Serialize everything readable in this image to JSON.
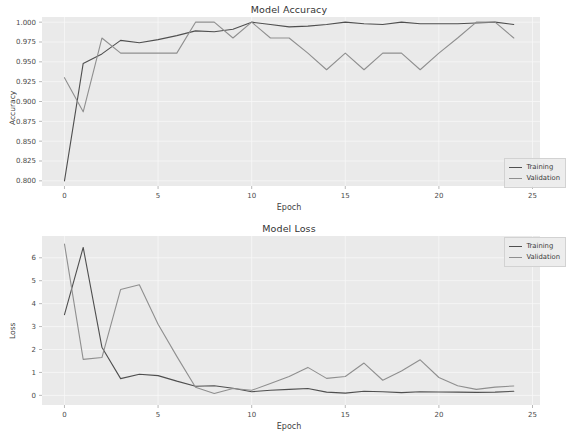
{
  "figure": {
    "width": 578,
    "height": 438,
    "background": "#ffffff",
    "plot_background": "#eaeaea",
    "grid_color": "#f7f7f7"
  },
  "colors": {
    "training": "#4f4f4f",
    "validation": "#8f8f8f",
    "text": "#3b3b3b"
  },
  "chart_data": [
    {
      "type": "line",
      "title": "Model Accuracy",
      "xlabel": "Epoch",
      "ylabel": "Accuracy",
      "xlim": [
        -1.2,
        25.4
      ],
      "ylim": [
        0.7935,
        1.0065
      ],
      "xticks": [
        0,
        5,
        10,
        15,
        20,
        25
      ],
      "xtick_labels": [
        "0",
        "5",
        "10",
        "15",
        "20",
        "25"
      ],
      "yticks": [
        0.8,
        0.825,
        0.85,
        0.875,
        0.9,
        0.925,
        0.95,
        0.975,
        1.0
      ],
      "ytick_labels": [
        "0.800",
        "0.825",
        "0.850",
        "0.875",
        "0.900",
        "0.925",
        "0.950",
        "0.975",
        "1.000"
      ],
      "grid": true,
      "legend_position": "lower right",
      "x": [
        0,
        1,
        2,
        3,
        4,
        5,
        6,
        7,
        8,
        9,
        10,
        11,
        12,
        13,
        14,
        15,
        16,
        17,
        18,
        19,
        20,
        21,
        22,
        23,
        24
      ],
      "series": [
        {
          "name": "Training",
          "values": [
            0.8,
            0.948,
            0.96,
            0.977,
            0.974,
            0.978,
            0.983,
            0.989,
            0.988,
            0.991,
            1.0,
            0.997,
            0.994,
            0.995,
            0.997,
            1.0,
            0.998,
            0.997,
            1.0,
            0.998,
            0.998,
            0.998,
            0.999,
            1.0,
            0.997
          ]
        },
        {
          "name": "Validation",
          "values": [
            0.93,
            0.887,
            0.98,
            0.961,
            0.961,
            0.961,
            0.961,
            1.0,
            1.0,
            0.98,
            1.0,
            0.98,
            0.98,
            0.961,
            0.94,
            0.961,
            0.94,
            0.961,
            0.961,
            0.94,
            0.961,
            0.98,
            1.0,
            1.0,
            0.98
          ]
        }
      ]
    },
    {
      "type": "line",
      "title": "Model Loss",
      "xlabel": "Epoch",
      "ylabel": "Loss",
      "xlim": [
        -1.2,
        25.4
      ],
      "ylim": [
        -0.42,
        6.95
      ],
      "xticks": [
        0,
        5,
        10,
        15,
        20,
        25
      ],
      "xtick_labels": [
        "0",
        "5",
        "10",
        "15",
        "20",
        "25"
      ],
      "yticks": [
        0,
        1,
        2,
        3,
        4,
        5,
        6
      ],
      "ytick_labels": [
        "0",
        "1",
        "2",
        "3",
        "4",
        "5",
        "6"
      ],
      "grid": true,
      "legend_position": "upper right",
      "x": [
        0,
        1,
        2,
        3,
        4,
        5,
        6,
        7,
        8,
        9,
        10,
        11,
        12,
        13,
        14,
        15,
        16,
        17,
        18,
        19,
        20,
        21,
        22,
        23,
        24
      ],
      "series": [
        {
          "name": "Training",
          "values": [
            3.52,
            6.45,
            2.1,
            0.73,
            0.92,
            0.86,
            0.62,
            0.4,
            0.42,
            0.31,
            0.16,
            0.22,
            0.26,
            0.3,
            0.14,
            0.1,
            0.18,
            0.16,
            0.12,
            0.16,
            0.15,
            0.14,
            0.13,
            0.14,
            0.18
          ]
        },
        {
          "name": "Validation",
          "values": [
            6.6,
            1.57,
            1.65,
            4.62,
            4.82,
            3.1,
            1.7,
            0.35,
            0.08,
            0.3,
            0.22,
            0.52,
            0.82,
            1.22,
            0.74,
            0.82,
            1.41,
            0.66,
            1.06,
            1.55,
            0.78,
            0.42,
            0.26,
            0.36,
            0.41
          ]
        }
      ]
    }
  ],
  "legend": {
    "training_label": "Training",
    "validation_label": "Validation"
  },
  "background_text": [
    "entitled score T which became a concern",
    "and there was a marked ten",
    "from the training history",
    "Loss",
    "for the model"
  ]
}
